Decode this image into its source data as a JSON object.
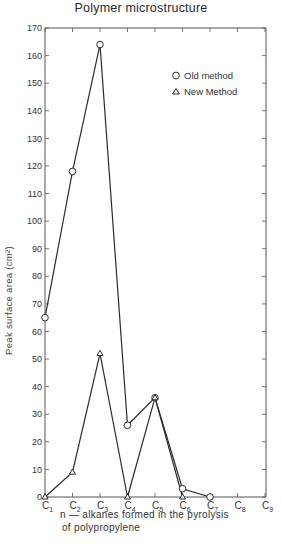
{
  "chart_data": {
    "type": "line",
    "title": "Polymer microstructure",
    "xlabel_line1": "n — alkanes formed in the pyrolysis",
    "xlabel_line2": "of polypropylene",
    "ylabel": "Peak surface area (cm²)",
    "categories": [
      "C1",
      "C2",
      "C3",
      "C4",
      "C5",
      "C6",
      "C7",
      "C8",
      "C9"
    ],
    "category_labels": [
      {
        "base": "C",
        "sub": "1"
      },
      {
        "base": "C",
        "sub": "2"
      },
      {
        "base": "C",
        "sub": "3"
      },
      {
        "base": "C",
        "sub": "4"
      },
      {
        "base": "C",
        "sub": "5"
      },
      {
        "base": "C",
        "sub": "6"
      },
      {
        "base": "C",
        "sub": "7"
      },
      {
        "base": "C",
        "sub": "8"
      },
      {
        "base": "C",
        "sub": "9"
      }
    ],
    "yticks": [
      0,
      10,
      20,
      30,
      40,
      50,
      60,
      70,
      80,
      90,
      100,
      110,
      120,
      130,
      140,
      150,
      160,
      170
    ],
    "ylim": [
      0,
      170
    ],
    "grid": false,
    "legend_position": "upper right (inside)",
    "series": [
      {
        "name": "Old method",
        "marker": "circle",
        "x": [
          "C1",
          "C2",
          "C3",
          "C4",
          "C5",
          "C6",
          "C7"
        ],
        "values": [
          65,
          118,
          164,
          26,
          36,
          3,
          0
        ]
      },
      {
        "name": "New Method",
        "marker": "triangle",
        "x": [
          "C1",
          "C2",
          "C3",
          "C4",
          "C5",
          "C6"
        ],
        "values": [
          0,
          9,
          52,
          0,
          36,
          0
        ]
      }
    ]
  },
  "legend": {
    "old": "Old method",
    "new": "New Method"
  },
  "colors": {
    "line": "#2b2b2b",
    "axis": "#555555",
    "text": "#333333"
  }
}
